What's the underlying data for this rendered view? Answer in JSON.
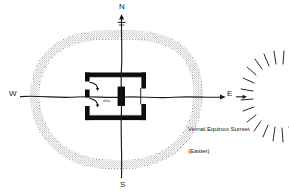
{
  "diagram": {
    "cardinals": {
      "north": "N",
      "south": "S",
      "west": "W",
      "east": "E"
    },
    "annotations": {
      "sunset_line1": "Vernal Equinox Sunset",
      "sunset_line2": "(Easter)",
      "altar": "altar"
    },
    "icons": {
      "north_arrow": "north-arrow-icon",
      "east_arrow": "east-arrow-icon",
      "sun": "sun-burst-icon",
      "door_swing_upper": "door-swing-arrow-icon",
      "door_swing_lower": "door-swing-arrow-icon"
    },
    "colors": {
      "ink": "#111111",
      "enclosure_gray": "#9a9a9a",
      "enclosure_gray_light": "#bdbdbd",
      "background": "#ffffff",
      "caption_text": "#222222"
    },
    "elements": {
      "enclosure": "stippled gray oval enclosure ring",
      "building": "black walled rectangular building",
      "altar_block": "solid black altar block at center",
      "axis_ns": "north-south axis line",
      "axis_ew": "east-west axis line"
    }
  }
}
